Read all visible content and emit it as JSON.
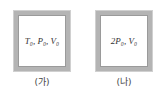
{
  "containers": [
    {
      "state": "T₀, P₀, V₀",
      "caption": "(가)"
    },
    {
      "state": "2P₀, V₀",
      "caption": "(나)"
    }
  ]
}
